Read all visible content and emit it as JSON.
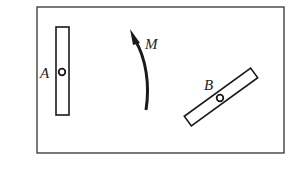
{
  "diagram": {
    "frame": {
      "x": 37,
      "y": 7,
      "width": 247,
      "height": 146
    },
    "rod_A": {
      "label": "A",
      "pivot": {
        "x": 62,
        "y": 72
      },
      "orientation": "vertical"
    },
    "rod_B": {
      "label": "B",
      "pivot": {
        "x": 220,
        "y": 98
      },
      "orientation": "tilted"
    },
    "moment": {
      "label": "M",
      "direction": "counterclockwise-upward"
    },
    "colors": {
      "stroke": "#1a1a1a",
      "background": "#ffffff"
    }
  }
}
